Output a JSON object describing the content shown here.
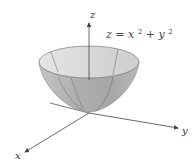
{
  "figure": {
    "equation": {
      "lhs": "z",
      "eq": "=",
      "x": "x",
      "x_exp": "2",
      "plus": "+",
      "y": "y",
      "y_exp": "2"
    },
    "axes": {
      "x_label": "x",
      "y_label": "y",
      "z_label": "z"
    },
    "colors": {
      "surface_dark": "#a9a9a9",
      "surface_light": "#dcdcdc",
      "rim": "#cfcfcf",
      "edge": "#6e6e6e",
      "axis": "#444444"
    }
  }
}
